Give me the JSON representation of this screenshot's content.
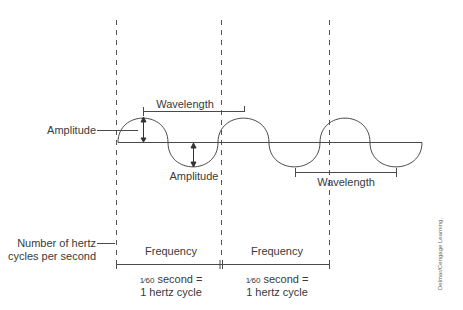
{
  "diagram": {
    "labels": {
      "amplitude_left": "Amplitude",
      "amplitude_bottom": "Amplitude",
      "wavelength_top": "Wavelength",
      "wavelength_bottom": "Wavelength",
      "hertz_line1": "Number of hertz",
      "hertz_line2": "cycles per second",
      "frequency_1": "Frequency",
      "frequency_2": "Frequency",
      "fraction_1": "1⁄60",
      "second_1": "second =",
      "cycle_1": "1 hertz cycle",
      "fraction_2": "1⁄60",
      "second_2": "second =",
      "cycle_2": "1 hertz cycle",
      "credit": "Delmar/Cengage Learning."
    },
    "colors": {
      "line": "#4a4a4a",
      "text": "#3a3a3a",
      "background": "#ffffff"
    }
  }
}
